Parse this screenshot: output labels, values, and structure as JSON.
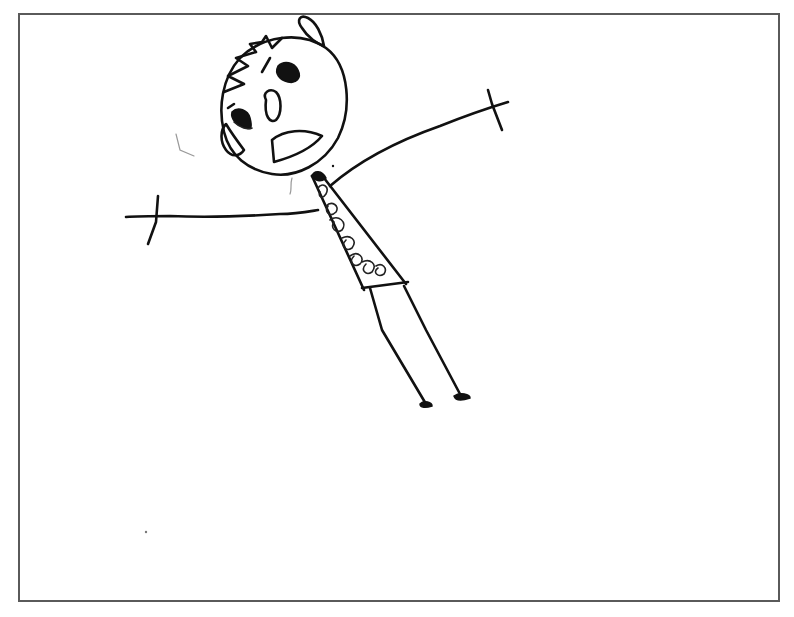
{
  "image": {
    "description": "Child's hand-drawn stick figure with a round head, spiky hair, startled open mouth, outstretched arms with cross-shaped hands, a patterned torso, and two long legs, inside a thin grey rectangular frame.",
    "colors": {
      "background": "#ffffff",
      "ink": "#111111",
      "frame": "#5a5a5a"
    },
    "frame": {
      "left": 18,
      "top": 13,
      "right": 781,
      "bottom": 603
    }
  }
}
